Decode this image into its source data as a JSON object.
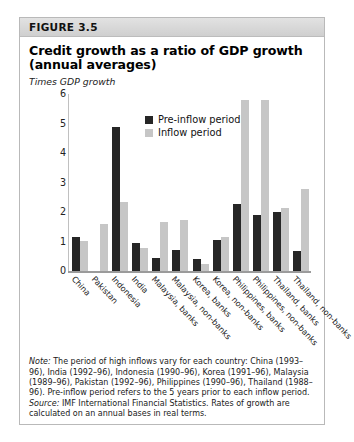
{
  "figure": {
    "header_label": "FIGURE 3.5",
    "title": "Credit growth as a ratio of GDP growth (annual averages)",
    "axis_note": "Times GDP growth"
  },
  "legend": {
    "items": [
      {
        "label": "Pre-inflow period",
        "color": "#262626"
      },
      {
        "label": "Inflow period",
        "color": "#c6c6c6"
      }
    ]
  },
  "notes": {
    "note_lead": "Note:",
    "note_text": " The period of high inflows vary for each country: China (1993–96), India (1992–96), Indonesia (1990–96), Korea (1991–96), Malaysia (1989–96), Pakistan (1992–96), Philippines (1990–96), Thailand (1988–96).  Pre-inflow period refers to the 5 years prior to each inflow period.",
    "source_lead": "Source:",
    "source_text": " IMF International Financial Statistics.  Rates of growth are calculated on an annual bases in real terms."
  },
  "chart_data": {
    "type": "bar",
    "title": "Credit growth as a ratio of GDP growth (annual averages)",
    "xlabel": "",
    "ylabel": "Times GDP growth",
    "ylim": [
      0,
      6
    ],
    "yticks": [
      0,
      1,
      2,
      3,
      4,
      5,
      6
    ],
    "grid": false,
    "legend_position": "top-center",
    "categories": [
      "China",
      "Pakistan",
      "Indonesia",
      "India",
      "Malaysia, banks",
      "Malaysia, non-banks",
      "Korea, banks",
      "Korea, non-banks",
      "Philippines, banks",
      "Philippines, non-banks",
      "Thailand, banks",
      "Thailand, non-banks"
    ],
    "series": [
      {
        "name": "Pre-inflow period",
        "color": "#262626",
        "values": [
          1.15,
          0,
          4.88,
          0.98,
          0.45,
          0.73,
          0.42,
          1.08,
          2.3,
          1.9,
          2.02,
          0.68
        ]
      },
      {
        "name": "Inflow period",
        "color": "#c6c6c6",
        "values": [
          1.03,
          1.62,
          2.35,
          0.78,
          1.68,
          1.76,
          0.25,
          1.18,
          5.8,
          5.8,
          2.15,
          2.78
        ]
      }
    ]
  }
}
